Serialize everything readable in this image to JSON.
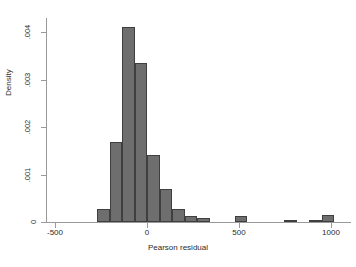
{
  "chart_data": {
    "type": "bar",
    "title": "",
    "subtitle": "",
    "xlabel": "Pearson residual",
    "ylabel": "Density",
    "xlim": [
      -550,
      1110
    ],
    "ylim": [
      0,
      0.0043
    ],
    "grid": false,
    "legend": null,
    "xticks": [
      -500,
      0,
      500,
      1000
    ],
    "xtick_labels": [
      "-500",
      "0",
      "500",
      "1000"
    ],
    "yticks": [
      0,
      0.001,
      0.002,
      0.003,
      0.004
    ],
    "ytick_labels": [
      "0",
      ".001",
      ".002",
      ".003",
      ".004"
    ],
    "bin_width": 68,
    "bar_color": "#6e6e6e",
    "bar_edge_color": "#3f3f3f",
    "axis_color": "#9a9a9a",
    "bins": [
      {
        "left": -272,
        "right": -204,
        "density": 0.00028
      },
      {
        "left": -204,
        "right": -136,
        "density": 0.00168
      },
      {
        "left": -136,
        "right": -68,
        "density": 0.00412
      },
      {
        "left": -68,
        "right": 0,
        "density": 0.00335
      },
      {
        "left": 0,
        "right": 68,
        "density": 0.00142
      },
      {
        "left": 68,
        "right": 136,
        "density": 0.0007
      },
      {
        "left": 136,
        "right": 204,
        "density": 0.00027
      },
      {
        "left": 204,
        "right": 272,
        "density": 0.00012
      },
      {
        "left": 272,
        "right": 340,
        "density": 8e-05
      },
      {
        "left": 476,
        "right": 544,
        "density": 0.00012
      },
      {
        "left": 748,
        "right": 816,
        "density": 4e-05
      },
      {
        "left": 884,
        "right": 952,
        "density": 5e-05
      },
      {
        "left": 952,
        "right": 1020,
        "density": 0.00014
      }
    ]
  }
}
